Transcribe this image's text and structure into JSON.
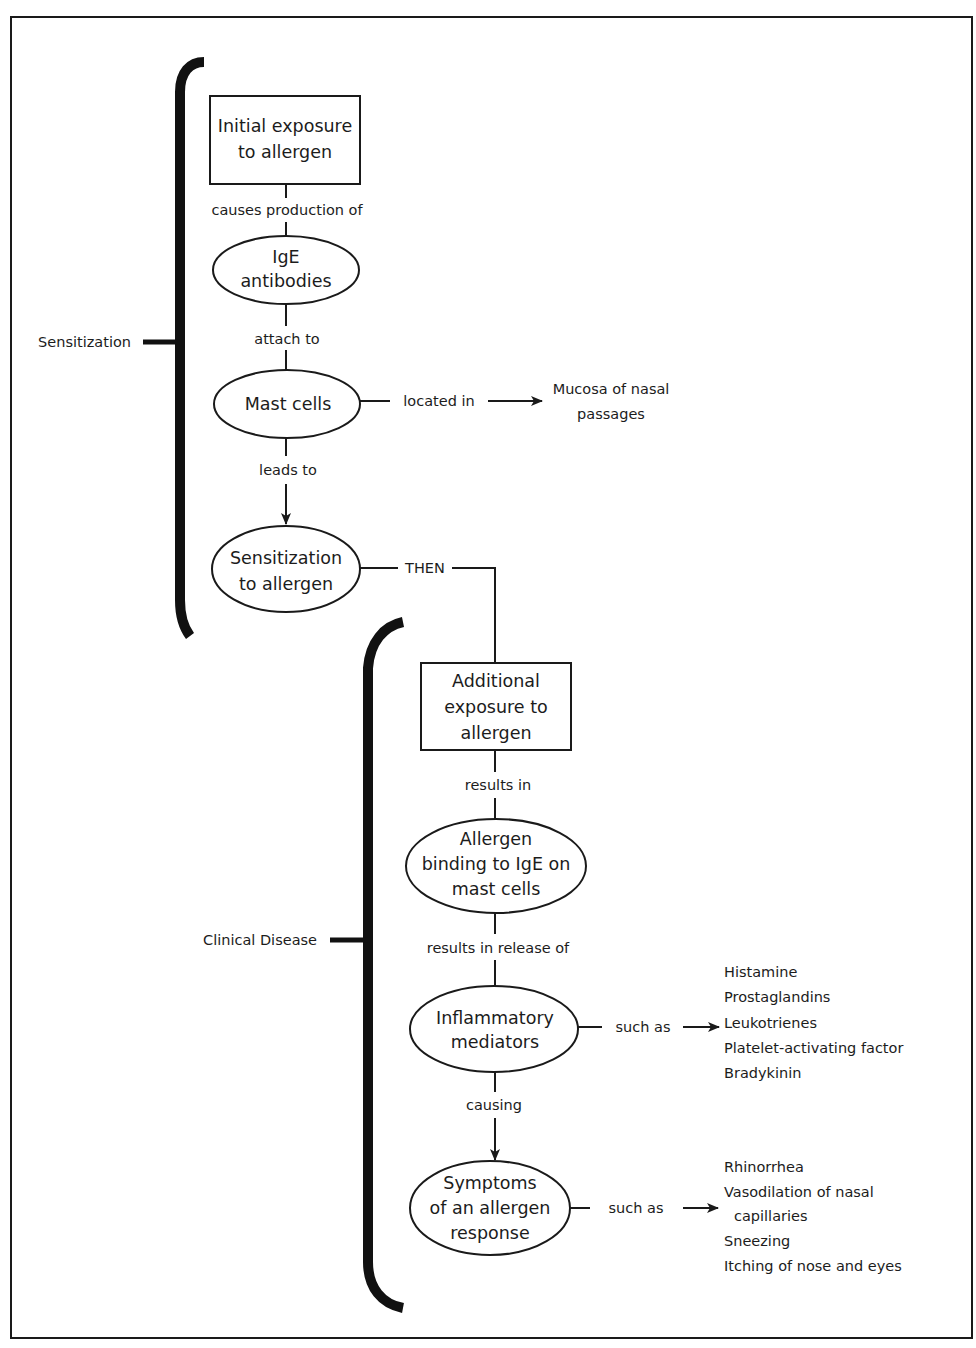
{
  "diagram": {
    "colors": {
      "stroke": "#1a1a1a",
      "text": "#1c1c1c",
      "background": "#ffffff"
    },
    "phases": [
      {
        "id": "sensitization",
        "label": "Sensitization",
        "bracket": {
          "x": 185,
          "top": 60,
          "bottom": 636,
          "tick_y": 342
        }
      },
      {
        "id": "clinical",
        "label": "Clinical Disease",
        "bracket": {
          "x": 372,
          "top": 620,
          "bottom": 1306,
          "tick_y": 940
        }
      }
    ],
    "nodes": [
      {
        "id": "initial_exposure",
        "shape": "rect",
        "lines": [
          "Initial exposure",
          "to allergen"
        ],
        "x": 210,
        "y": 96,
        "w": 150,
        "h": 88
      },
      {
        "id": "ige_antibodies",
        "shape": "ellipse",
        "lines": [
          "IgE",
          "antibodies"
        ],
        "cx": 286,
        "cy": 270,
        "rx": 73,
        "ry": 34
      },
      {
        "id": "mast_cells",
        "shape": "ellipse",
        "lines": [
          "Mast cells"
        ],
        "cx": 287,
        "cy": 404,
        "rx": 73,
        "ry": 34
      },
      {
        "id": "sensitization_to_allergen",
        "shape": "ellipse",
        "lines": [
          "Sensitization",
          "to allergen"
        ],
        "cx": 286,
        "cy": 569,
        "rx": 74,
        "ry": 43
      },
      {
        "id": "additional_exposure",
        "shape": "rect",
        "lines": [
          "Additional",
          "exposure to",
          "allergen"
        ],
        "x": 421,
        "y": 663,
        "w": 150,
        "h": 87
      },
      {
        "id": "allergen_binding",
        "shape": "ellipse",
        "lines": [
          "Allergen",
          "binding to IgE on",
          "mast cells"
        ],
        "cx": 496,
        "cy": 866,
        "rx": 90,
        "ry": 47
      },
      {
        "id": "inflammatory_mediators",
        "shape": "ellipse",
        "lines": [
          "Inflammatory",
          "mediators"
        ],
        "cx": 494,
        "cy": 1029,
        "rx": 84,
        "ry": 43
      },
      {
        "id": "symptoms",
        "shape": "ellipse",
        "lines": [
          "Symptoms",
          "of an allergen",
          "response"
        ],
        "cx": 490,
        "cy": 1208,
        "rx": 80,
        "ry": 47
      }
    ],
    "edges": [
      {
        "from": "initial_exposure",
        "to": "ige_antibodies",
        "label": "causes production of",
        "arrow": false
      },
      {
        "from": "ige_antibodies",
        "to": "mast_cells",
        "label": "attach to",
        "arrow": false
      },
      {
        "from": "mast_cells",
        "to": "sensitization_to_allergen",
        "label": "leads to",
        "arrow": true
      },
      {
        "from": "mast_cells",
        "to": "mucosa",
        "label": "located in",
        "arrow": true
      },
      {
        "from": "sensitization_to_allergen",
        "to": "additional_exposure",
        "label": "THEN",
        "arrow": false
      },
      {
        "from": "additional_exposure",
        "to": "allergen_binding",
        "label": "results in",
        "arrow": false
      },
      {
        "from": "allergen_binding",
        "to": "inflammatory_mediators",
        "label": "results in release of",
        "arrow": false
      },
      {
        "from": "inflammatory_mediators",
        "to": "symptoms",
        "label": "causing",
        "arrow": true
      },
      {
        "from": "inflammatory_mediators",
        "to": "mediator_examples",
        "label": "such as",
        "arrow": true
      },
      {
        "from": "symptoms",
        "to": "symptom_examples",
        "label": "such as",
        "arrow": true
      }
    ],
    "targets": {
      "mucosa": {
        "lines": [
          "Mucosa of nasal",
          "passages"
        ]
      },
      "mediator_examples": {
        "items": [
          "Histamine",
          "Prostaglandins",
          "Leukotrienes",
          "Platelet-activating factor",
          "Bradykinin"
        ]
      },
      "symptom_examples": {
        "items": [
          "Rhinorrhea",
          "Vasodilation of nasal",
          "capillaries",
          "Sneezing",
          "Itching of nose and eyes"
        ]
      }
    }
  }
}
